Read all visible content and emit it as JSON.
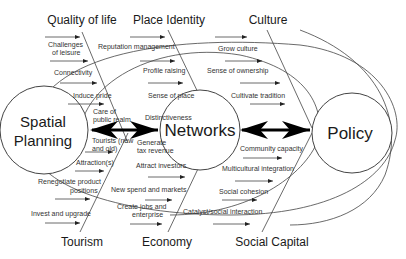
{
  "categories": {
    "top": [
      "Quality of life",
      "Place Identity",
      "Culture"
    ],
    "bottom": [
      "Tourism",
      "Economy",
      "Social Capital"
    ]
  },
  "nodes": {
    "left": [
      "Spatial",
      "Planning"
    ],
    "center": "Networks",
    "right": "Policy"
  },
  "factors": {
    "quality_of_life": [
      "Challenges",
      "of leisure",
      "Connectivity",
      "Induce pride",
      "Care of",
      "public realm"
    ],
    "place_identity": [
      "Reputation management",
      "Profile raising",
      "Sense of place",
      "Distinctiveness"
    ],
    "culture": [
      "Grow culture",
      "Sense of ownership",
      "Cultivate tradition"
    ],
    "tourism": [
      "Tourists (new",
      "and old)",
      "Attraction(s)",
      "Renegotiate product",
      "positions",
      "Invest and upgrade"
    ],
    "economy": [
      "Generate",
      "tax revenue",
      "Attract investors",
      "New spend and markets",
      "Create jobs and",
      "enterprise"
    ],
    "social_capital": [
      "Community capacity",
      "Multicultural integration",
      "Social cohesion",
      "Catalyst/social interaction"
    ]
  }
}
